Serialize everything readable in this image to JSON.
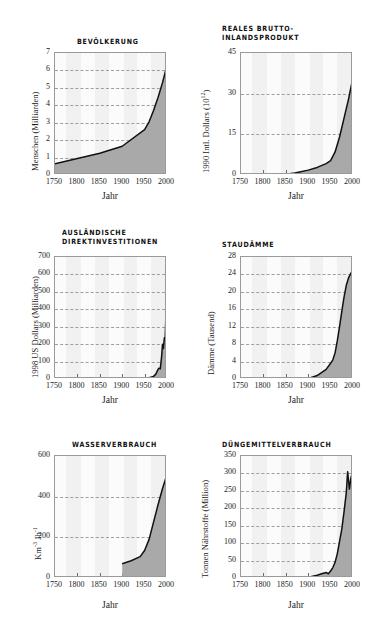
{
  "figure": {
    "axis_label_x": "Jahr",
    "n_panels": 6
  },
  "chart_data": [
    {
      "type": "area",
      "title": "BEVÖLKERUNG",
      "xlabel": "Jahr",
      "ylabel": "Menschen (Milliarden)",
      "xlim": [
        1750,
        2000
      ],
      "ylim": [
        0,
        7
      ],
      "xticks": [
        1750,
        1800,
        1850,
        1900,
        1950,
        2000
      ],
      "yticks": [
        0,
        1,
        2,
        3,
        4,
        5,
        6,
        7
      ],
      "grid": "dashed-horizontal",
      "x": [
        1750,
        1800,
        1850,
        1900,
        1950,
        1960,
        1970,
        1980,
        1990,
        2000
      ],
      "values": [
        0.65,
        0.95,
        1.25,
        1.65,
        2.6,
        3.05,
        3.7,
        4.45,
        5.3,
        6.3
      ]
    },
    {
      "type": "area",
      "title": "REALES BRUTTO-\nINLANDSPRODUKT",
      "xlabel": "Jahr",
      "ylabel": "1990 Intl. Dollars (10",
      "ylabel_sup": "12",
      "ylabel_tail": ")",
      "xlim": [
        1750,
        2000
      ],
      "ylim": [
        0,
        45
      ],
      "xticks": [
        1750,
        1800,
        1850,
        1900,
        1950,
        2000
      ],
      "yticks": [
        0,
        15,
        30,
        45
      ],
      "grid": "dashed-horizontal",
      "x": [
        1850,
        1870,
        1900,
        1920,
        1940,
        1950,
        1960,
        1970,
        1980,
        1990,
        2000
      ],
      "values": [
        0.3,
        0.7,
        1.8,
        2.8,
        4.2,
        5.3,
        8.5,
        14.0,
        21.0,
        28.0,
        36.0
      ]
    },
    {
      "type": "area",
      "title": "AUSLÄNDISCHE\nDIREKTINVESTITIONEN",
      "xlabel": "Jahr",
      "ylabel": "1998 US Dollars (Milliarden)",
      "xlim": [
        1750,
        2000
      ],
      "ylim": [
        0,
        700
      ],
      "xticks": [
        1750,
        1800,
        1850,
        1900,
        1950,
        2000
      ],
      "yticks": [
        0,
        100,
        200,
        300,
        400,
        500,
        600,
        700
      ],
      "grid": "dashed-horizontal",
      "x": [
        1950,
        1960,
        1970,
        1975,
        1980,
        1982,
        1985,
        1988,
        1990,
        1992,
        1994,
        1996,
        1998,
        2000
      ],
      "values": [
        3,
        8,
        15,
        28,
        55,
        62,
        58,
        130,
        200,
        175,
        235,
        240,
        400,
        620
      ]
    },
    {
      "type": "area",
      "title": "STAUDÄMME",
      "xlabel": "Jahr",
      "ylabel": "Dämme (Tausend)",
      "xlim": [
        1750,
        2000
      ],
      "ylim": [
        0,
        28
      ],
      "xticks": [
        1750,
        1800,
        1850,
        1900,
        1950,
        2000
      ],
      "yticks": [
        0,
        4,
        8,
        12,
        16,
        20,
        24,
        28
      ],
      "grid": "dashed-horizontal",
      "x": [
        1900,
        1920,
        1940,
        1950,
        1955,
        1960,
        1965,
        1970,
        1975,
        1980,
        1985,
        1990,
        1995,
        2000
      ],
      "values": [
        0.1,
        0.8,
        2.2,
        3.6,
        4.4,
        6.0,
        8.8,
        12.0,
        15.5,
        18.8,
        21.5,
        23.2,
        24.2,
        25.2
      ]
    },
    {
      "type": "area",
      "title": "WASSERVERBRAUCH",
      "xlabel": "Jahr",
      "ylabel_pre": "Km",
      "ylabel_sup1": "-3",
      "ylabel_mid": " Jh",
      "ylabel_sup2": "-1",
      "ylabel": "Km-3 Jh-1",
      "xlim": [
        1750,
        2000
      ],
      "ylim": [
        0,
        600
      ],
      "xticks": [
        1750,
        1800,
        1850,
        1900,
        1950,
        2000
      ],
      "yticks": [
        0,
        200,
        400,
        600
      ],
      "grid": "dashed-horizontal",
      "x": [
        1900,
        1920,
        1940,
        1950,
        1960,
        1970,
        1980,
        1990,
        2000
      ],
      "values": [
        70,
        85,
        105,
        135,
        190,
        275,
        360,
        440,
        510
      ]
    },
    {
      "type": "area",
      "title": "DÜNGEMITTELVERBRAUCH",
      "xlabel": "Jahr",
      "ylabel": "Tonnen Nährstoffe (Million)",
      "xlim": [
        1750,
        2000
      ],
      "ylim": [
        0,
        350
      ],
      "xticks": [
        1750,
        1800,
        1850,
        1900,
        1950,
        2000
      ],
      "yticks": [
        0,
        50,
        100,
        150,
        200,
        250,
        300,
        350
      ],
      "grid": "dashed-horizontal",
      "x": [
        1900,
        1920,
        1930,
        1940,
        1945,
        1950,
        1955,
        1960,
        1965,
        1970,
        1975,
        1980,
        1985,
        1988,
        1992,
        1995,
        2000
      ],
      "values": [
        2,
        8,
        12,
        16,
        12,
        20,
        30,
        45,
        70,
        105,
        140,
        190,
        245,
        305,
        255,
        285,
        310
      ]
    }
  ],
  "colors": {
    "fill": "#a9a9a9",
    "line": "#111111",
    "grid": "#9e9e9e",
    "plot_bg": "#fbfbfb",
    "band": "#f1f1f1",
    "axis": "#9a9a9a",
    "text": "#1a1a1a"
  }
}
